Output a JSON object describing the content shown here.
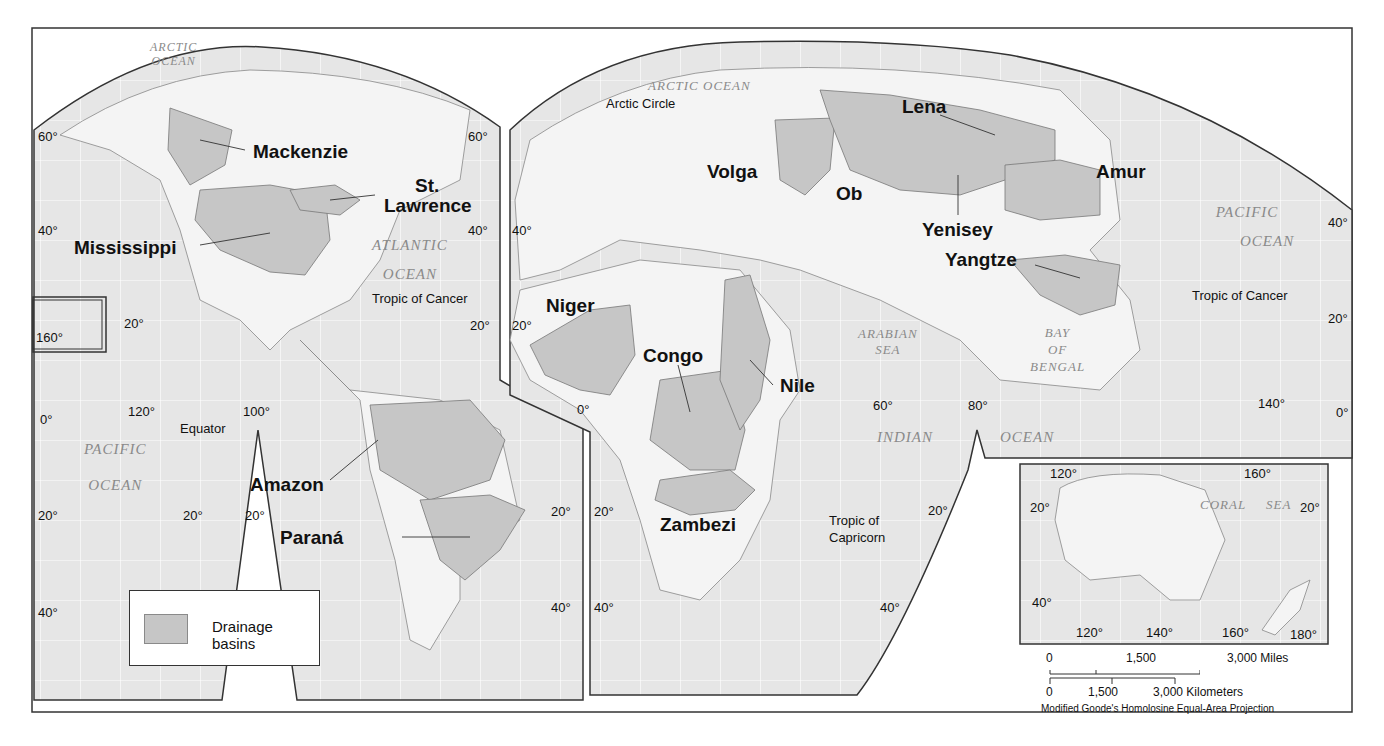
{
  "map": {
    "title": "World Major River Drainage Basins",
    "projection": "Modified Goode's Homolosine Equal-Area Projection",
    "colors": {
      "ocean": "#e6e6e6",
      "land": "#f4f4f4",
      "basin": "#c6c6c6",
      "graticule": "#ffffff",
      "border": "#333333"
    },
    "legend": {
      "label": "Drainage basins",
      "swatch_color": "#c6c6c6"
    },
    "rivers": [
      {
        "name": "Mackenzie"
      },
      {
        "name": "St."
      },
      {
        "name": "Lawrence"
      },
      {
        "name": "Mississippi"
      },
      {
        "name": "Amazon"
      },
      {
        "name": "Paraná"
      },
      {
        "name": "Volga"
      },
      {
        "name": "Ob"
      },
      {
        "name": "Lena"
      },
      {
        "name": "Yenisey"
      },
      {
        "name": "Amur"
      },
      {
        "name": "Yangtze"
      },
      {
        "name": "Niger"
      },
      {
        "name": "Congo"
      },
      {
        "name": "Nile"
      },
      {
        "name": "Zambezi"
      }
    ],
    "water_bodies": [
      {
        "name": "ARCTIC",
        "name2": "OCEAN"
      },
      {
        "name": "ATLANTIC",
        "name2": "OCEAN"
      },
      {
        "name": "PACIFIC",
        "name2": "OCEAN"
      },
      {
        "name": "ARCTIC OCEAN"
      },
      {
        "name": "ARABIAN",
        "name2": "SEA"
      },
      {
        "name": "BAY",
        "name2": "OF",
        "name3": "BENGAL"
      },
      {
        "name": "INDIAN"
      },
      {
        "name": "OCEAN"
      },
      {
        "name": "PACIFIC",
        "name2": "OCEAN"
      },
      {
        "name": "CORAL"
      },
      {
        "name": "SEA"
      }
    ],
    "lines": {
      "arctic_circle": "Arctic Circle",
      "tropic_cancer_west": "Tropic of Cancer",
      "tropic_cancer_east": "Tropic of Cancer",
      "equator": "Equator",
      "tropic_capricorn_1": "Tropic of",
      "tropic_capricorn_2": "Capricorn"
    },
    "degrees": {
      "nw_60": "60°",
      "ne_60": "60°",
      "w_40": "40°",
      "wr_40": "40°",
      "e_40": "40°",
      "far_e_40": "40°",
      "w_20": "20°",
      "wr_20": "20°",
      "e_20": "20°",
      "far_e_20": "20°",
      "w_0": "0°",
      "e_0_africa": "0°",
      "far_e_0": "0°",
      "lon_160_hawaii": "160°",
      "lon_120": "120°",
      "lon_100": "100°",
      "sa_20a": "20°",
      "sa_20b": "20°",
      "sa_20c": "20°",
      "w_s40": "40°",
      "sa_s40": "40°",
      "af_20": "20°",
      "af_40": "40°",
      "in_60": "60°",
      "in_80": "80°",
      "in_20": "20°",
      "in_40": "40°",
      "as_140": "140°",
      "au_120": "120°",
      "au_160": "160°",
      "au_20w": "20°",
      "au_20e": "20°",
      "au_40": "40°",
      "au_120b": "120°",
      "au_140b": "140°",
      "au_160b": "160°",
      "au_180": "180°"
    },
    "scale": {
      "miles_0": "0",
      "miles_1500": "1,500",
      "miles_3000": "3,000 Miles",
      "km_0": "0",
      "km_1500": "1,500",
      "km_3000": "3,000 Kilometers"
    }
  }
}
